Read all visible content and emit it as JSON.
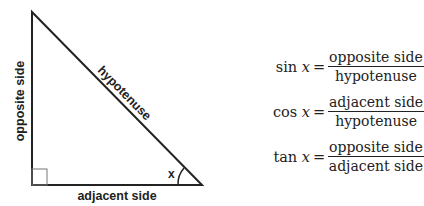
{
  "diagram": {
    "type": "right-triangle",
    "labels": {
      "hypotenuse": "hypotenuse",
      "opposite": "opposite side",
      "adjacent": "adjacent side",
      "angle": "x"
    },
    "colors": {
      "stroke": "#222222",
      "right_angle_marker": "#666666"
    }
  },
  "formulas": [
    {
      "fn": "sin",
      "var": "x",
      "eq": "=",
      "numerator": "opposite side",
      "denominator": "hypotenuse"
    },
    {
      "fn": "cos",
      "var": "x",
      "eq": "=",
      "numerator": "adjacent side",
      "denominator": "hypotenuse"
    },
    {
      "fn": "tan",
      "var": "x",
      "eq": "=",
      "numerator": "opposite side",
      "denominator": "adjacent side"
    }
  ]
}
